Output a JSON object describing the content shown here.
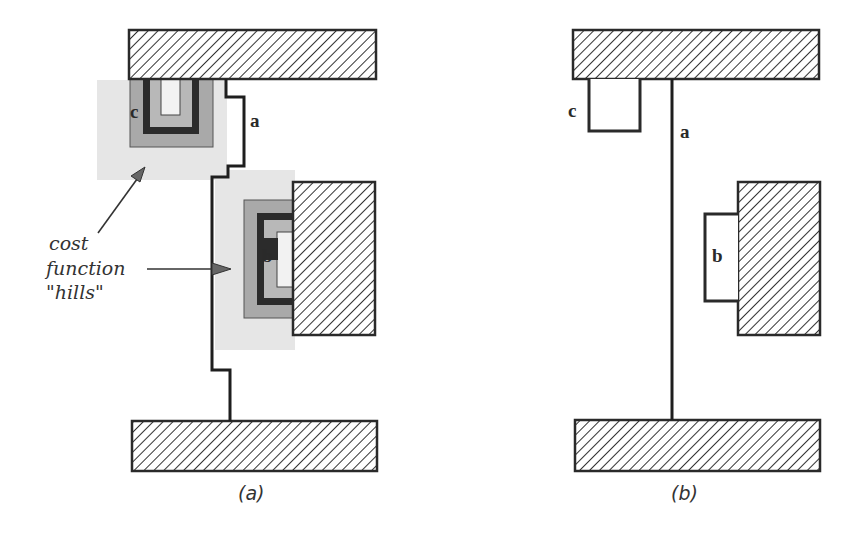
{
  "panels": [
    {
      "id": "a",
      "caption": "(a)",
      "net_label": "a",
      "pin_labels": [
        "c",
        "b"
      ],
      "annotation": {
        "lines": [
          "cost",
          "function",
          "\"hills\""
        ]
      }
    },
    {
      "id": "b",
      "caption": "(b)",
      "net_label": "a",
      "pin_labels": [
        "c",
        "b"
      ]
    }
  ],
  "colors": {
    "block_stroke": "#2a2a2a",
    "hill_outer": "#e6e6e6",
    "hill_mid": "#a9a9a9",
    "hill_ring": "#2b2b2b",
    "hill_inner": "#b8b8b8",
    "hill_core": "#f2f2f2"
  }
}
